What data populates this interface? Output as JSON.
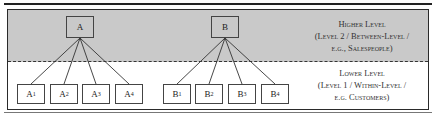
{
  "diagram": {
    "higher_level": {
      "nodes": [
        {
          "id": "A",
          "label": "A"
        },
        {
          "id": "B",
          "label": "B"
        }
      ],
      "label_lines": [
        "Higher Level",
        "(Level 2 / Between-Level /",
        "e.g., Salespeople)"
      ]
    },
    "lower_level": {
      "nodes": [
        {
          "id": "A1",
          "base": "A",
          "sub": "1",
          "parent": "A"
        },
        {
          "id": "A2",
          "base": "A",
          "sub": "2",
          "parent": "A"
        },
        {
          "id": "A3",
          "base": "A",
          "sub": "3",
          "parent": "A"
        },
        {
          "id": "A4",
          "base": "A",
          "sub": "4",
          "parent": "A"
        },
        {
          "id": "B1",
          "base": "B",
          "sub": "1",
          "parent": "B"
        },
        {
          "id": "B2",
          "base": "B",
          "sub": "2",
          "parent": "B"
        },
        {
          "id": "B3",
          "base": "B",
          "sub": "3",
          "parent": "B"
        },
        {
          "id": "B4",
          "base": "B",
          "sub": "4",
          "parent": "B"
        }
      ],
      "label_lines": [
        "Lower Level",
        "(Level 1 / Within-Level /",
        "e.g. Customers)"
      ]
    },
    "colors": {
      "upper_fill": "#c9c9c9",
      "lower_fill": "#ffffff",
      "stroke": "#333333"
    }
  }
}
